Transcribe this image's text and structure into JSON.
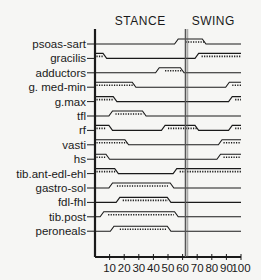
{
  "chart_data": {
    "type": "timeline",
    "title": "",
    "phase_labels": [
      {
        "label": "STANCE",
        "center_pct": 31
      },
      {
        "label": "SWING",
        "center_pct": 81
      }
    ],
    "phase_divider_pct": 62,
    "xlabel": "",
    "ylabel": "",
    "xlim": [
      0,
      100
    ],
    "x_ticks": [
      10,
      20,
      30,
      40,
      50,
      60,
      70,
      80,
      90,
      100
    ],
    "series_note": "Muscle activity during gait cycle (% of cycle); raised segments = active, dotted = peak activity",
    "muscles": [
      {
        "name": "psoas-sart",
        "active": [
          [
            57,
            76
          ]
        ],
        "dotted": [
          [
            62,
            75
          ]
        ]
      },
      {
        "name": "gracilis",
        "active": [
          [
            0,
            8
          ],
          [
            71,
            100
          ]
        ],
        "dotted": [
          [
            1,
            6
          ],
          [
            73,
            100
          ]
        ]
      },
      {
        "name": "adductors",
        "active": [
          [
            44,
            61
          ]
        ],
        "dotted": [
          [
            48,
            60
          ]
        ]
      },
      {
        "name": "g. med-min",
        "active": [
          [
            0,
            28
          ],
          [
            92,
            100
          ]
        ],
        "dotted": [
          [
            1,
            27
          ],
          [
            94,
            100
          ]
        ]
      },
      {
        "name": "g.max",
        "active": [
          [
            0,
            15
          ],
          [
            94,
            100
          ]
        ],
        "dotted": [
          [
            1,
            13
          ],
          [
            96,
            100
          ]
        ]
      },
      {
        "name": "tfl",
        "active": [
          [
            12,
            35
          ]
        ],
        "dotted": [
          [
            14,
            33
          ]
        ]
      },
      {
        "name": "rf",
        "active": [
          [
            0,
            12
          ],
          [
            48,
            71
          ],
          [
            94,
            100
          ]
        ],
        "dotted": [
          [
            1,
            7
          ],
          [
            50,
            70
          ],
          [
            96,
            100
          ]
        ]
      },
      {
        "name": "vasti",
        "active": [
          [
            0,
            23
          ],
          [
            87,
            100
          ]
        ],
        "dotted": [
          [
            1,
            22
          ],
          [
            88,
            100
          ]
        ]
      },
      {
        "name": "hs",
        "active": [
          [
            0,
            10
          ],
          [
            86,
            100
          ]
        ],
        "dotted": [
          [
            1,
            7
          ],
          [
            88,
            100
          ]
        ]
      },
      {
        "name": "tib.ant-edl-ehl",
        "active": [
          [
            0,
            16
          ],
          [
            56,
            100
          ]
        ],
        "dotted": [
          [
            1,
            14
          ],
          [
            58,
            100
          ]
        ]
      },
      {
        "name": "gastro-sol",
        "active": [
          [
            12,
            54
          ]
        ],
        "dotted": [
          [
            15,
            50
          ]
        ]
      },
      {
        "name": "fdl-fhl",
        "active": [
          [
            17,
            52
          ]
        ],
        "dotted": [
          [
            19,
            50
          ]
        ]
      },
      {
        "name": "tib.post",
        "active": [
          [
            6,
            57
          ]
        ],
        "dotted": [
          [
            9,
            54
          ]
        ]
      },
      {
        "name": "peroneals",
        "active": [
          [
            13,
            52
          ]
        ],
        "dotted": [
          [
            17,
            49
          ]
        ]
      }
    ]
  },
  "colors": {
    "background": "#f6f6f4",
    "ink": "#1a1a1a",
    "divider": "#555555"
  }
}
